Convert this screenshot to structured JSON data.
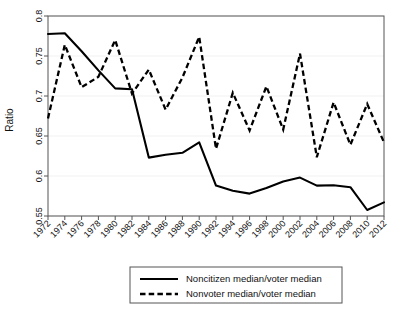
{
  "chart_data": {
    "type": "line",
    "title": "",
    "xlabel": "",
    "ylabel": "Ratio",
    "ylim": [
      0.55,
      0.8
    ],
    "yticks": [
      0.55,
      0.6,
      0.65,
      0.7,
      0.75,
      0.8
    ],
    "ytick_labels": [
      "0.55",
      "0.6",
      "0.65",
      "0.7",
      "0.75",
      "0.8"
    ],
    "grid": true,
    "legend_position": "below-center",
    "x": [
      1972,
      1974,
      1976,
      1978,
      1980,
      1982,
      1984,
      1986,
      1988,
      1990,
      1992,
      1994,
      1996,
      1998,
      2000,
      2002,
      2004,
      2006,
      2008,
      2010,
      2012
    ],
    "xtick_labels": [
      "1972",
      "1974",
      "1976",
      "1978",
      "1980",
      "1982",
      "1984",
      "1986",
      "1988",
      "1990",
      "1992",
      "1994",
      "1996",
      "1998",
      "2000",
      "2002",
      "2004",
      "2006",
      "2008",
      "2010",
      "2012"
    ],
    "series": [
      {
        "name": "Noncitizen median/voter median",
        "style": "solid",
        "color": "#000000",
        "values": [
          0.7775,
          0.7785,
          0.756,
          0.732,
          0.7095,
          0.7085,
          0.623,
          0.6265,
          0.629,
          0.642,
          0.588,
          0.5815,
          0.578,
          0.585,
          0.593,
          0.598,
          0.588,
          0.5885,
          0.586,
          0.5575,
          0.567
        ]
      },
      {
        "name": "Nonvoter median/voter median",
        "style": "dashed",
        "color": "#000000",
        "values": [
          0.672,
          0.764,
          0.711,
          0.724,
          0.77,
          0.703,
          0.733,
          0.683,
          0.723,
          0.774,
          0.634,
          0.704,
          0.657,
          0.712,
          0.658,
          0.753,
          0.6235,
          0.692,
          0.639,
          0.69,
          0.642
        ]
      }
    ]
  },
  "legend": {
    "entries": [
      {
        "label": "Noncitizen median/voter median",
        "style": "solid"
      },
      {
        "label": "Nonvoter median/voter median",
        "style": "dashed"
      }
    ]
  }
}
